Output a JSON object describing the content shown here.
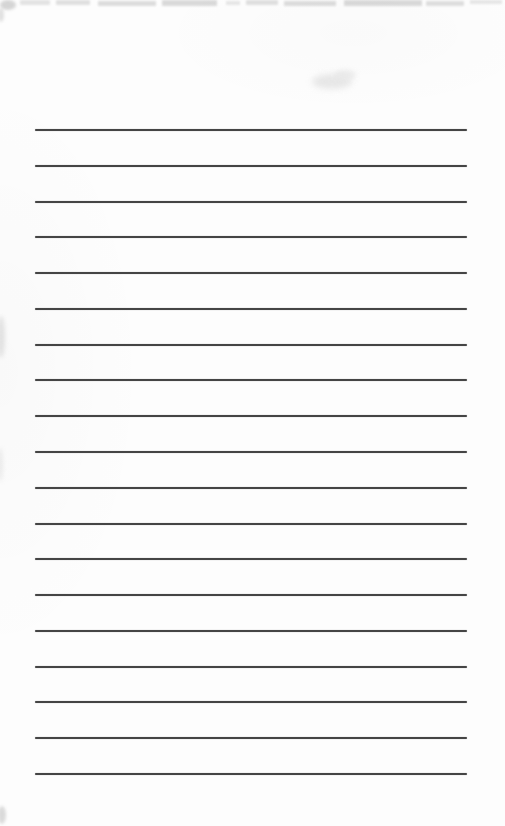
{
  "page": {
    "background_color": "#fdfdfd",
    "rule_lines": {
      "count": 19,
      "first_y": 129,
      "spacing": 35.78,
      "left": 35,
      "right": 467,
      "thickness": 2,
      "color": "#454545"
    },
    "scan_artifacts": [
      {
        "name": "scan-artifact-top-corner",
        "x": 0,
        "y": 0,
        "w": 16,
        "h": 10,
        "color": "#9a9a9a",
        "opacity": 0.4,
        "blur": 1.5,
        "round": true
      },
      {
        "name": "scan-artifact-top-edge",
        "x": 20,
        "y": 0,
        "w": 30,
        "h": 5,
        "color": "#8a8a8a",
        "opacity": 0.22,
        "blur": 1.2
      },
      {
        "name": "scan-artifact-top-edge",
        "x": 56,
        "y": 0,
        "w": 34,
        "h": 5,
        "color": "#8a8a8a",
        "opacity": 0.25,
        "blur": 1.2
      },
      {
        "name": "scan-artifact-top-edge",
        "x": 98,
        "y": 1,
        "w": 58,
        "h": 5,
        "color": "#8a8a8a",
        "opacity": 0.28,
        "blur": 1.2
      },
      {
        "name": "scan-artifact-top-edge",
        "x": 162,
        "y": 0,
        "w": 55,
        "h": 6,
        "color": "#8a8a8a",
        "opacity": 0.3,
        "blur": 1.2
      },
      {
        "name": "scan-artifact-top-edge",
        "x": 226,
        "y": 1,
        "w": 14,
        "h": 4,
        "color": "#8a8a8a",
        "opacity": 0.2,
        "blur": 1.2
      },
      {
        "name": "scan-artifact-top-edge",
        "x": 246,
        "y": 0,
        "w": 32,
        "h": 5,
        "color": "#8a8a8a",
        "opacity": 0.25,
        "blur": 1.2
      },
      {
        "name": "scan-artifact-top-edge",
        "x": 284,
        "y": 1,
        "w": 52,
        "h": 5,
        "color": "#8a8a8a",
        "opacity": 0.28,
        "blur": 1.2
      },
      {
        "name": "scan-artifact-top-edge",
        "x": 344,
        "y": 0,
        "w": 78,
        "h": 6,
        "color": "#8a8a8a",
        "opacity": 0.3,
        "blur": 1.2
      },
      {
        "name": "scan-artifact-top-edge",
        "x": 426,
        "y": 1,
        "w": 38,
        "h": 5,
        "color": "#8a8a8a",
        "opacity": 0.26,
        "blur": 1.2
      },
      {
        "name": "scan-artifact-top-edge",
        "x": 470,
        "y": 0,
        "w": 32,
        "h": 4,
        "color": "#8a8a8a",
        "opacity": 0.2,
        "blur": 1.2
      },
      {
        "name": "scan-artifact-left-mark",
        "x": -2,
        "y": 8,
        "w": 6,
        "h": 14,
        "color": "#c9c9c9",
        "opacity": 0.55,
        "blur": 1.5,
        "round": true
      },
      {
        "name": "scan-artifact-ghost-mark",
        "x": 312,
        "y": 74,
        "w": 40,
        "h": 15,
        "color": "#e4e4e4",
        "opacity": 0.85,
        "blur": 3,
        "round": true
      },
      {
        "name": "scan-artifact-ghost-mark",
        "x": 334,
        "y": 70,
        "w": 22,
        "h": 10,
        "color": "#e8e8e8",
        "opacity": 0.8,
        "blur": 2.5,
        "round": true
      },
      {
        "name": "scan-artifact-left-smudge",
        "x": -3,
        "y": 316,
        "w": 8,
        "h": 42,
        "color": "#dadada",
        "opacity": 0.7,
        "blur": 2,
        "round": true
      },
      {
        "name": "scan-artifact-left-smudge",
        "x": -3,
        "y": 448,
        "w": 6,
        "h": 34,
        "color": "#e0e0e0",
        "opacity": 0.55,
        "blur": 2,
        "round": true
      },
      {
        "name": "scan-artifact-corner-mark",
        "x": -2,
        "y": 806,
        "w": 8,
        "h": 18,
        "color": "#cfcfcf",
        "opacity": 0.75,
        "blur": 1.5,
        "round": true
      }
    ]
  }
}
